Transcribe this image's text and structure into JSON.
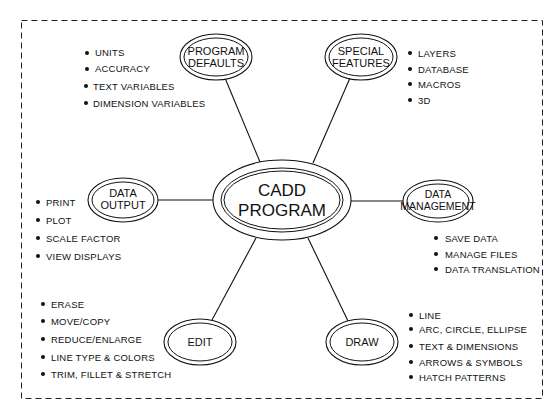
{
  "diagram": {
    "center": {
      "line1": "CADD",
      "line2": "PROGRAM"
    },
    "nodes": {
      "program_defaults": {
        "line1": "PROGRAM",
        "line2": "DEFAULTS",
        "items": [
          "UNITS",
          "ACCURACY",
          "TEXT VARIABLES",
          "DIMENSION VARIABLES"
        ]
      },
      "special_features": {
        "line1": "SPECIAL",
        "line2": "FEATURES",
        "items": [
          "LAYERS",
          "DATABASE",
          "MACROS",
          "3D"
        ]
      },
      "data_output": {
        "line1": "DATA",
        "line2": "OUTPUT",
        "items": [
          "PRINT",
          "PLOT",
          "SCALE FACTOR",
          "VIEW DISPLAYS"
        ]
      },
      "data_management": {
        "line1": "DATA",
        "line2": "MANAGEMENT",
        "items": [
          "SAVE DATA",
          "MANAGE FILES",
          "DATA TRANSLATION"
        ]
      },
      "edit": {
        "line1": "EDIT",
        "items": [
          "ERASE",
          "MOVE/COPY",
          "REDUCE/ENLARGE",
          "LINE TYPE & COLORS",
          "TRIM, FILLET & STRETCH"
        ]
      },
      "draw": {
        "line1": "DRAW",
        "items": [
          "LINE",
          "ARC, CIRCLE, ELLIPSE",
          "TEXT & DIMENSIONS",
          "ARROWS & SYMBOLS",
          "HATCH PATTERNS"
        ]
      }
    },
    "colors": {
      "ink": "#111111",
      "background": "#ffffff"
    }
  }
}
